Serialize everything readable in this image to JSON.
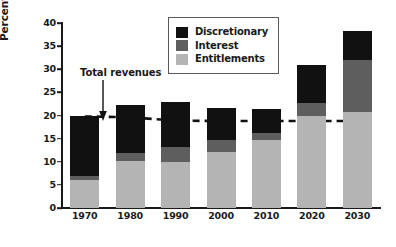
{
  "chart_data": {
    "type": "bar",
    "title": "",
    "subtitle": "",
    "xlabel": "",
    "ylabel": "Percentage of GDP",
    "categories": [
      "1970",
      "1980",
      "1990",
      "2000",
      "2010",
      "2020",
      "2030"
    ],
    "stacked": true,
    "ylim": [
      0,
      40
    ],
    "yticks": [
      "0",
      "5",
      "10",
      "15",
      "20",
      "25",
      "30",
      "35",
      "40"
    ],
    "grid": false,
    "legend_position": "top-center",
    "series": [
      {
        "name": "Entitlements",
        "color": "#b4b4b4",
        "values": [
          6.0,
          10.2,
          10.0,
          12.2,
          14.8,
          19.9,
          20.8
        ]
      },
      {
        "name": "Interest",
        "color": "#5e5e5e",
        "values": [
          1.0,
          1.8,
          3.2,
          2.6,
          1.5,
          2.7,
          11.2
        ]
      },
      {
        "name": "Discretionary",
        "color": "#111111",
        "values": [
          13.0,
          10.3,
          9.8,
          6.9,
          5.2,
          8.4,
          6.3
        ]
      }
    ],
    "totals": [
      20.0,
      22.3,
      23.0,
      21.7,
      21.5,
      31.0,
      38.3
    ],
    "annotations": [
      {
        "name": "total-revenues",
        "text": "Total revenues",
        "arrow": "down"
      }
    ],
    "reference_line": {
      "name": "Total revenues",
      "style": "dashed",
      "color": "#111111",
      "x": [
        "1970",
        "1980",
        "1990",
        "2000",
        "2010",
        "2020",
        "2030"
      ],
      "values": [
        19.8,
        19.6,
        18.9,
        18.8,
        18.8,
        18.8,
        18.8
      ]
    }
  }
}
